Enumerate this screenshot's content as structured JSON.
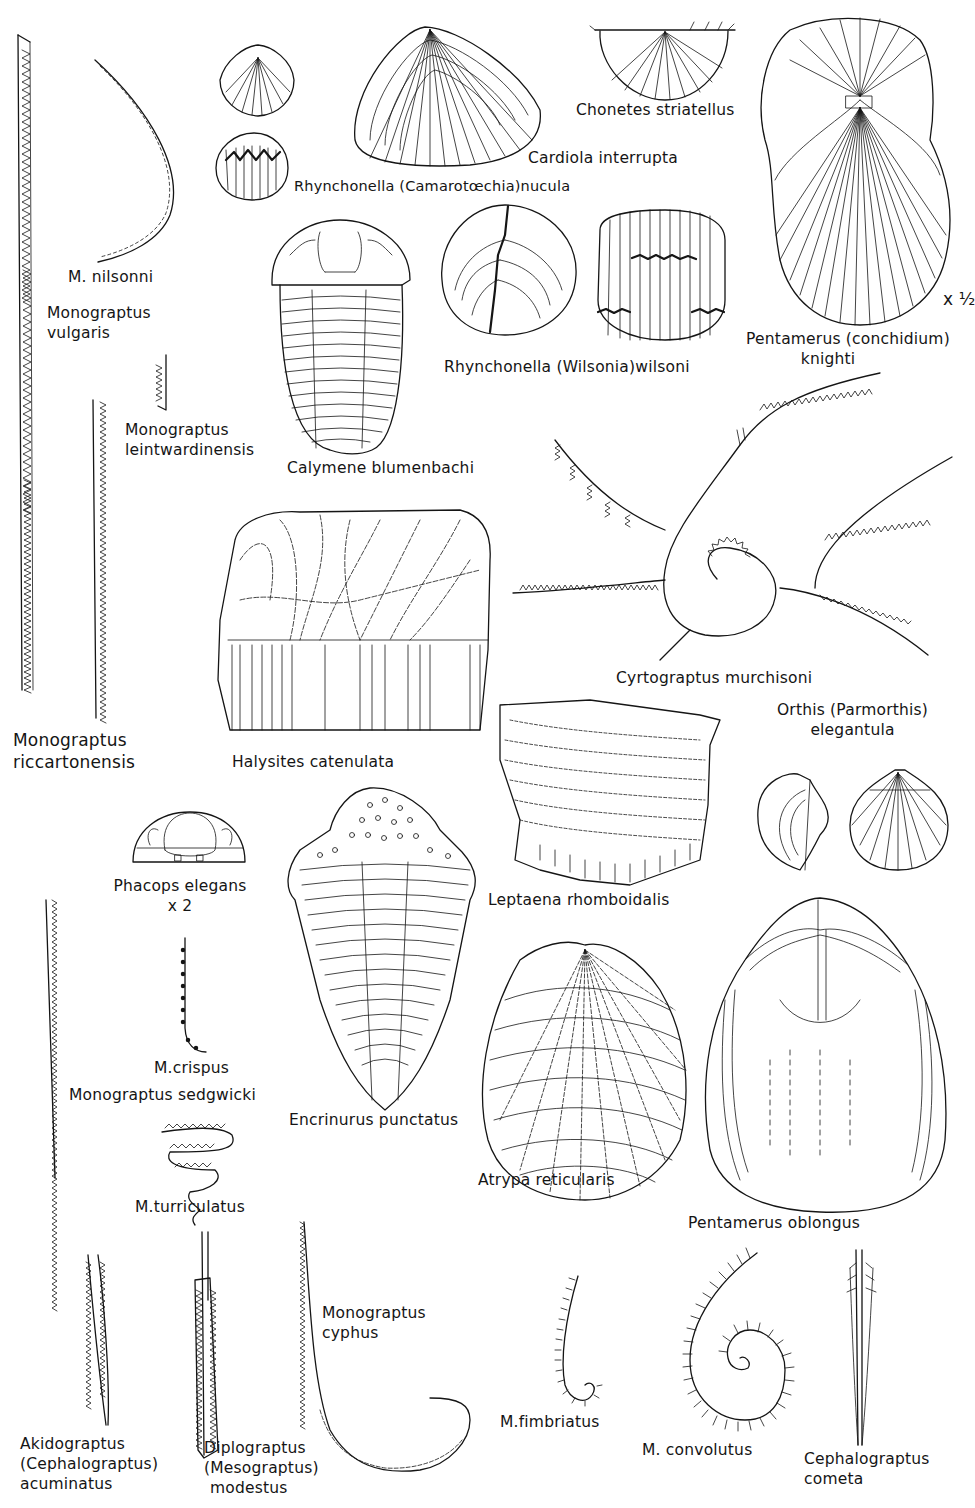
{
  "plate": {
    "background": "#ffffff",
    "ink": "#151515",
    "scale_note": "x ½"
  },
  "specimens": [
    {
      "id": "m_vulgaris",
      "label_lines": [
        "Monograptus",
        "vulgaris"
      ],
      "type": "graptolite"
    },
    {
      "id": "m_nilsonni",
      "label_lines": [
        "M. nilsonni"
      ],
      "type": "graptolite"
    },
    {
      "id": "rhynchonella_nucula",
      "label_lines": [
        "Rhynchonella (Camarotœchia)nucula"
      ],
      "type": "brachiopod"
    },
    {
      "id": "cardiola",
      "label_lines": [
        "Cardiola interrupta"
      ],
      "type": "bivalve"
    },
    {
      "id": "chonetes",
      "label_lines": [
        "Chonetes striatellus"
      ],
      "type": "brachiopod"
    },
    {
      "id": "pentamerus_knighti",
      "label_lines": [
        "Pentamerus (conchidium)",
        "knighti"
      ],
      "type": "brachiopod",
      "scale": "x ½"
    },
    {
      "id": "m_leintwardinensis",
      "label_lines": [
        "Monograptus",
        "leintwardinensis"
      ],
      "type": "graptolite"
    },
    {
      "id": "calymene",
      "label_lines": [
        "Calymene blumenbachi"
      ],
      "type": "trilobite"
    },
    {
      "id": "rhynchonella_wilsoni",
      "label_lines": [
        "Rhynchonella (Wilsonia)wilsoni"
      ],
      "type": "brachiopod"
    },
    {
      "id": "m_riccartonensis",
      "label_lines": [
        "Monograptus",
        "riccartonensis"
      ],
      "type": "graptolite"
    },
    {
      "id": "halysites",
      "label_lines": [
        "Halysites catenulata"
      ],
      "type": "coral"
    },
    {
      "id": "cyrtograptus",
      "label_lines": [
        "Cyrtograptus murchisoni"
      ],
      "type": "graptolite"
    },
    {
      "id": "orthis",
      "label_lines": [
        "Orthis (Parmorthis)",
        "elegantula"
      ],
      "type": "brachiopod"
    },
    {
      "id": "phacops",
      "label_lines": [
        "Phacops elegans",
        "x 2"
      ],
      "type": "trilobite"
    },
    {
      "id": "leptaena",
      "label_lines": [
        "Leptaena rhomboidalis"
      ],
      "type": "brachiopod"
    },
    {
      "id": "encrinurus",
      "label_lines": [
        "Encrinurus punctatus"
      ],
      "type": "trilobite"
    },
    {
      "id": "m_crispus",
      "label_lines": [
        "M.crispus"
      ],
      "type": "graptolite"
    },
    {
      "id": "m_sedgwicki",
      "label_lines": [
        "Monograptus sedgwicki"
      ],
      "type": "graptolite"
    },
    {
      "id": "m_turriculatus",
      "label_lines": [
        "M.turriculatus"
      ],
      "type": "graptolite"
    },
    {
      "id": "atrypa",
      "label_lines": [
        "Atrypa reticularis"
      ],
      "type": "brachiopod"
    },
    {
      "id": "pentamerus_oblongus",
      "label_lines": [
        "Pentamerus oblongus"
      ],
      "type": "brachiopod"
    },
    {
      "id": "akidograptus",
      "label_lines": [
        "Akidograptus",
        "(Cephalograptus)",
        "acuminatus"
      ],
      "type": "graptolite"
    },
    {
      "id": "diplograptus",
      "label_lines": [
        "Diplograptus",
        "(Mesograptus)",
        "modestus"
      ],
      "type": "graptolite"
    },
    {
      "id": "m_cyphus",
      "label_lines": [
        "Monograptus",
        "cyphus"
      ],
      "type": "graptolite"
    },
    {
      "id": "m_fimbriatus",
      "label_lines": [
        "M.fimbriatus"
      ],
      "type": "graptolite"
    },
    {
      "id": "m_convolutus",
      "label_lines": [
        "M. convolutus"
      ],
      "type": "graptolite"
    },
    {
      "id": "cephalograptus_cometa",
      "label_lines": [
        "Cephalograptus",
        "cometa"
      ],
      "type": "graptolite"
    }
  ]
}
